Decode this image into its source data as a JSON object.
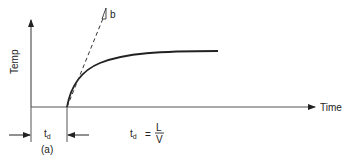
{
  "figure": {
    "y_axis_label": "Temp",
    "x_axis_label": "Time",
    "tangent_label": "b",
    "delay_symbol": "t",
    "delay_subscript": "d",
    "panel_label": "(a)",
    "equation": {
      "lhs": "t",
      "lhs_subscript": "d",
      "equals": "=",
      "numerator": "L",
      "denominator": "V"
    }
  },
  "colors": {
    "line": "#222222",
    "axis": "#555555",
    "background": "#ffffff"
  }
}
